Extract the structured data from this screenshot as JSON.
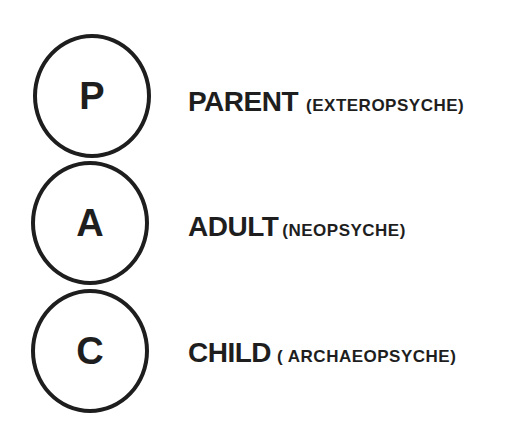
{
  "diagram": {
    "type": "ego-state-model",
    "states": [
      {
        "letter": "P",
        "label": "PARENT",
        "sub": "(EXTEROPSYCHE)"
      },
      {
        "letter": "A",
        "label": "ADULT",
        "sub": "(NEOPSYCHE)"
      },
      {
        "letter": "C",
        "label": "CHILD",
        "sub": "( ARCHAEOPSYCHE)"
      }
    ]
  }
}
